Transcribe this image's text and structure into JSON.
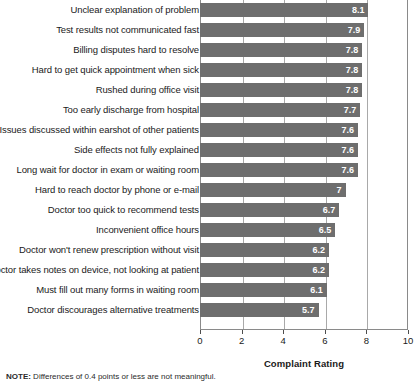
{
  "chart_data": {
    "type": "bar",
    "orientation": "horizontal",
    "title": "",
    "xlabel": "Complaint Rating",
    "ylabel": "",
    "xlim": [
      0,
      10
    ],
    "xticks": [
      0,
      2,
      4,
      6,
      8,
      10
    ],
    "xtick_labels": [
      "0",
      "2",
      "4",
      "6",
      "8",
      "10"
    ],
    "grid": true,
    "grid_axis": "x",
    "legend": false,
    "bar_color": "#6e6e6e",
    "value_label_color": "#ffffff",
    "categories": [
      "Unclear explanation of problem",
      "Test results not communicated fast",
      "Billing disputes hard to resolve",
      "Hard to get quick appointment when sick",
      "Rushed during office visit",
      "Too early discharge from hospital",
      "Issues discussed within earshot of other patients",
      "Side effects not fully explained",
      "Long wait for doctor in exam or waiting room",
      "Hard to reach doctor by phone or e-mail",
      "Doctor too quick to recommend tests",
      "Inconvenient office hours",
      "Doctor won't renew prescription without visit",
      "Doctor takes notes on device, not looking at patient",
      "Must fill out many forms in waiting room",
      "Doctor discourages alternative treatments"
    ],
    "values": [
      8.1,
      7.9,
      7.8,
      7.8,
      7.8,
      7.7,
      7.6,
      7.6,
      7.6,
      7,
      6.7,
      6.5,
      6.2,
      6.2,
      6.1,
      5.7
    ],
    "value_labels": [
      "8.1",
      "7.9",
      "7.8",
      "7.8",
      "7.8",
      "7.7",
      "7.6",
      "7.6",
      "7.6",
      "7",
      "6.7",
      "6.5",
      "6.2",
      "6.2",
      "6.1",
      "5.7"
    ]
  },
  "note": {
    "prefix": "NOTE:",
    "text": " Differences of 0.4 points or less are not meaningful."
  }
}
